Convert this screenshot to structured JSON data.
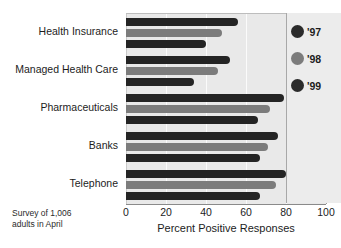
{
  "chart_data": {
    "type": "bar",
    "orientation": "horizontal",
    "title": "",
    "xlabel": "Percent Positive Responses",
    "ylabel": "",
    "xlim": [
      0,
      100
    ],
    "xticks": [
      0,
      20,
      40,
      60,
      80,
      100
    ],
    "grid": true,
    "legend_position": "right",
    "categories": [
      "Health Insurance",
      "Managed Health Care",
      "Pharmaceuticals",
      "Banks",
      "Telephone"
    ],
    "series": [
      {
        "name": "'97",
        "color": "#242424",
        "values": [
          56,
          52,
          79,
          76,
          80
        ]
      },
      {
        "name": "'98",
        "color": "#7c7c7c",
        "values": [
          48,
          46,
          72,
          71,
          75
        ]
      },
      {
        "name": "'99",
        "color": "#242424",
        "values": [
          40,
          34,
          66,
          67,
          67
        ]
      }
    ],
    "annotations": [
      "Survey of 1,006 adults in April"
    ]
  },
  "legend": {
    "items": [
      {
        "label": "'97",
        "color": "#2b2b2b"
      },
      {
        "label": "'98",
        "color": "#7c7c7c"
      },
      {
        "label": "'99",
        "color": "#2b2b2b"
      }
    ]
  },
  "source_note": {
    "line1": "Survey of 1,006",
    "line2": "adults in April"
  },
  "colors": {
    "plot_background": "#e9e9e9",
    "gridline": "#fbfbfb",
    "legend_background": "#ececec",
    "text": "#1c1c1c"
  }
}
